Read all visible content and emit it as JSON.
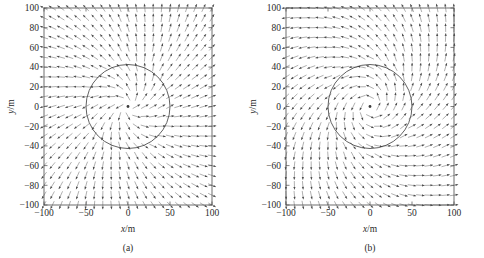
{
  "figure": {
    "background_color": "#ffffff",
    "line_color": "#4a4a4a",
    "arrow_color": "#6e6e6e"
  },
  "chart_data": [
    {
      "type": "scatter",
      "subtype": "vector-field",
      "panel_id": "a",
      "caption": "(a)",
      "title": "",
      "xlabel": "x/m",
      "ylabel": "y/m",
      "xlim": [
        -100,
        100
      ],
      "ylim": [
        -100,
        100
      ],
      "xticks": [
        -100,
        -50,
        0,
        50,
        100
      ],
      "yticks": [
        -100,
        -80,
        -60,
        -40,
        -20,
        0,
        20,
        40,
        60,
        80,
        100
      ],
      "xtick_labels": [
        "-100",
        "-50",
        "0",
        "50",
        "100"
      ],
      "ytick_labels": [
        "-100",
        "-80",
        "-60",
        "-40",
        "-20",
        "0",
        "20",
        "40",
        "60",
        "80",
        "100"
      ],
      "grid": false,
      "legend": "none",
      "annotations": [
        {
          "kind": "circle",
          "center": [
            0,
            0
          ],
          "radius": 50,
          "label": "boundary circle r = 50 m"
        },
        {
          "kind": "point",
          "center": [
            0,
            0
          ],
          "label": "singular point at origin"
        }
      ],
      "field": {
        "model": "radial-outflow-with-weak-swirl",
        "grid_nx": 21,
        "grid_ny": 21,
        "grid_x_start": -100,
        "grid_x_end": 100,
        "grid_y_start": -100,
        "grid_y_end": 100,
        "swirl_strength": 0.3,
        "radial_strength": 1.0,
        "inner_radius": 50,
        "inner_swirl_strength": 0.55,
        "inner_radial_strength": 1.0,
        "arrow_length_px": 8.5,
        "arrow_head_px": 2.6
      }
    },
    {
      "type": "scatter",
      "subtype": "vector-field",
      "panel_id": "b",
      "caption": "(b)",
      "title": "",
      "xlabel": "x/m",
      "ylabel": "y/m",
      "xlim": [
        -100,
        100
      ],
      "ylim": [
        -100,
        100
      ],
      "xticks": [
        -100,
        -50,
        0,
        50,
        100
      ],
      "yticks": [
        -100,
        -80,
        -60,
        -40,
        -20,
        0,
        20,
        40,
        60,
        80,
        100
      ],
      "xtick_labels": [
        "-100",
        "-50",
        "0",
        "50",
        "100"
      ],
      "ytick_labels": [
        "-100",
        "-80",
        "-60",
        "-40",
        "-20",
        "0",
        "20",
        "40",
        "60",
        "80",
        "100"
      ],
      "grid": false,
      "legend": "none",
      "annotations": [
        {
          "kind": "circle",
          "center": [
            0,
            0
          ],
          "radius": 50,
          "label": "boundary circle r = 50 m"
        },
        {
          "kind": "point",
          "center": [
            0,
            0
          ],
          "label": "vortex centre at origin"
        }
      ],
      "field": {
        "model": "spiral-vortex",
        "grid_nx": 21,
        "grid_ny": 21,
        "grid_x_start": -100,
        "grid_x_end": 100,
        "grid_y_start": -100,
        "grid_y_end": 100,
        "swirl_strength": 1.0,
        "radial_strength": 0.85,
        "inner_radius": 50,
        "inner_swirl_strength": 1.45,
        "inner_radial_strength": 0.7,
        "arrow_length_px": 8.5,
        "arrow_head_px": 2.6
      }
    }
  ],
  "panels": [
    {
      "name": "panel-a",
      "caption": "(a)",
      "xlabel_var": "x",
      "xlabel_unit": "/m",
      "ylabel_var": "y",
      "ylabel_unit": "/m"
    },
    {
      "name": "panel-b",
      "caption": "(b)",
      "xlabel_var": "x",
      "xlabel_unit": "/m",
      "ylabel_var": "y",
      "ylabel_unit": "/m"
    }
  ]
}
